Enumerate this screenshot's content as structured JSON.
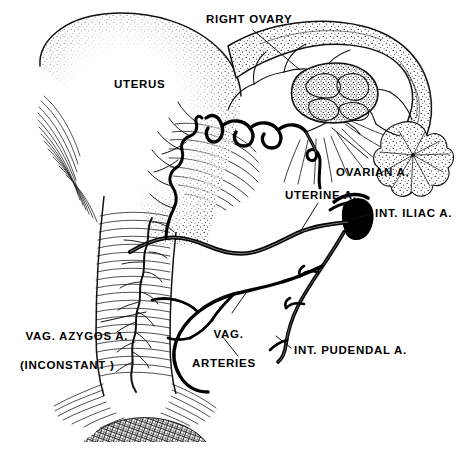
{
  "figure": {
    "background_color": "#ffffff",
    "ink_color": "#000000",
    "width": 458,
    "height": 452
  },
  "labels": {
    "right_ovary": "RIGHT OVARY",
    "uterus": "UTERUS",
    "ovarian_artery": "OVARIAN A.",
    "uterine_artery": "UTERINE A.",
    "internal_iliac_artery": "INT. ILIAC A.",
    "vaginal_azygos_artery_line1": "VAG. AZYGOS A.",
    "vaginal_azygos_artery_line2": "(INCONSTANT )",
    "vaginal_arteries_line1": "VAG.",
    "vaginal_arteries_line2": "ARTERIES",
    "internal_pudendal_artery": "INT. PUDENDAL A."
  },
  "structures": [
    {
      "name": "uterus-body",
      "description": "Stippled pear-shaped uterine corpus, fundus at upper left"
    },
    {
      "name": "vagina",
      "description": "Vertical vaginal canal with horizontal rugae hatching below cervix"
    },
    {
      "name": "vaginal-introitus",
      "description": "Dark cross-hatched base of the vagina"
    },
    {
      "name": "right-ovary",
      "description": "Stippled ovoid ovary with lobulated surface"
    },
    {
      "name": "fallopian-tube",
      "description": "Stippled tube arching from uterine cornu to the right"
    },
    {
      "name": "fimbriae",
      "description": "Flower-like fringed funnel at the distal end of the tube"
    },
    {
      "name": "broad-ligament",
      "description": "Fan of fine radiating lines beneath the tube and ovary"
    },
    {
      "name": "ovarian-artery",
      "description": "Tortuous artery entering the mesovarium from below"
    },
    {
      "name": "tubal-arcade",
      "description": "Serpentine arterial arcade under the tube anastomosing ovarian and uterine arteries"
    },
    {
      "name": "uterine-artery",
      "description": "Thick artery from internal iliac, ascending along lateral uterus"
    },
    {
      "name": "internal-iliac-artery",
      "description": "Short thick dark arterial stump at right"
    },
    {
      "name": "internal-pudendal-artery",
      "description": "Descending branch of internal iliac to the perineum"
    },
    {
      "name": "vaginal-arteries",
      "description": "Branching arteries supplying the lateral vaginal wall"
    },
    {
      "name": "vaginal-azygos-artery",
      "description": "Inconstant midline artery running down the vagina"
    }
  ]
}
